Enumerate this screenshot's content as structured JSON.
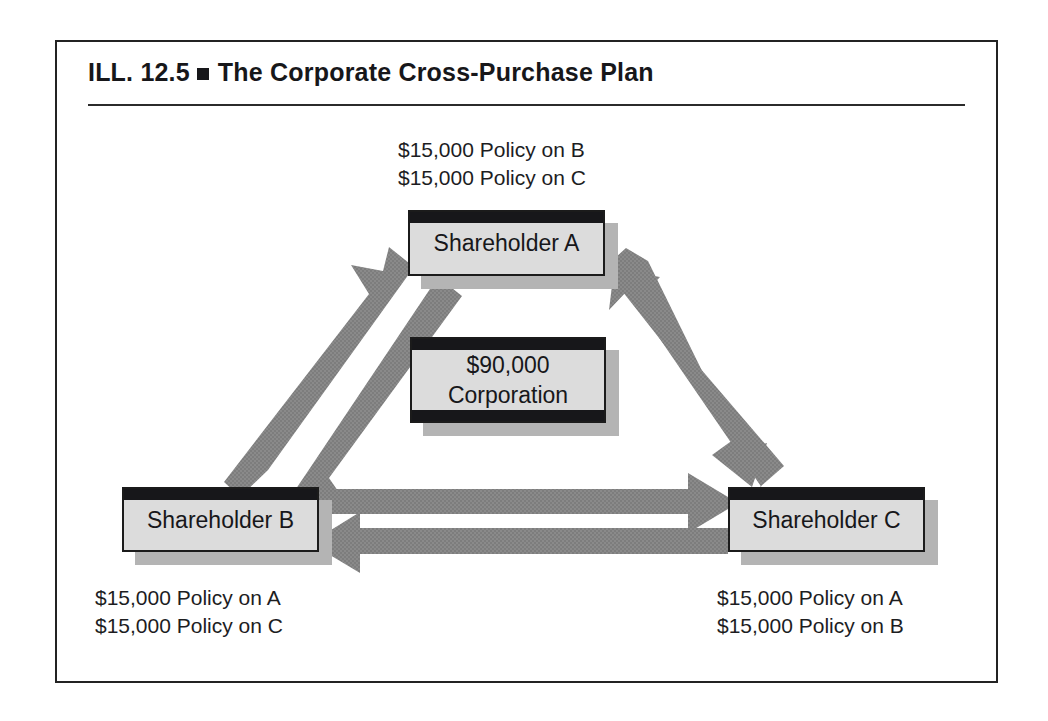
{
  "figure": {
    "number": "ILL. 12.5",
    "bullet": "square-bullet",
    "title": "The Corporate Cross-Purchase Plan"
  },
  "nodes": {
    "shareholder_a": {
      "label": "Shareholder A"
    },
    "corporation": {
      "amount": "$90,000",
      "entity": "Corporation"
    },
    "shareholder_b": {
      "label": "Shareholder B"
    },
    "shareholder_c": {
      "label": "Shareholder C"
    }
  },
  "captions": {
    "a": {
      "line1": "$15,000 Policy on B",
      "line2": "$15,000 Policy on C"
    },
    "b": {
      "line1": "$15,000 Policy on A",
      "line2": "$15,000 Policy on C"
    },
    "c": {
      "line1": "$15,000 Policy on A",
      "line2": "$15,000 Policy on B"
    }
  },
  "arrows": [
    {
      "name": "arrow-b-to-a",
      "from": "Shareholder B",
      "to": "Shareholder A",
      "direction": "up-right"
    },
    {
      "name": "arrow-a-to-b",
      "from": "Shareholder A",
      "to": "Shareholder B",
      "direction": "down-left"
    },
    {
      "name": "arrow-c-to-a",
      "from": "Shareholder C",
      "to": "Shareholder A",
      "direction": "up-left"
    },
    {
      "name": "arrow-a-to-c",
      "from": "Shareholder A",
      "to": "Shareholder C",
      "direction": "down-right"
    },
    {
      "name": "arrow-b-to-c",
      "from": "Shareholder B",
      "to": "Shareholder C",
      "direction": "right"
    },
    {
      "name": "arrow-c-to-b",
      "from": "Shareholder C",
      "to": "Shareholder B",
      "direction": "left"
    }
  ],
  "colors": {
    "arrow_gray": "#8a8a8a",
    "box_fill": "#dcdcdc",
    "box_shadow": "#b4b4b4",
    "ink": "#17171a",
    "frame": "#232323"
  }
}
